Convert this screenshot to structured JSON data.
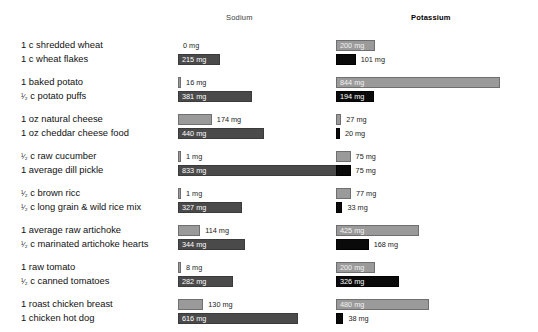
{
  "headers": {
    "sodium": "Sodium",
    "potassium": "Potassium"
  },
  "colors": {
    "light_bar": "#9a9a9a",
    "sodium_dark_bar": "#4a4a4a",
    "potassium_dark_bar": "#0a0a0a",
    "background": "#ffffff",
    "text": "#111111"
  },
  "units": "mg",
  "chart_data": {
    "type": "bar",
    "title": "",
    "subtitle": "",
    "xlabel": "",
    "ylabel": "",
    "orientation": "horizontal",
    "grid": false,
    "legend": [
      "Sodium",
      "Potassium"
    ],
    "legend_position": "top",
    "axis_max_mg": 850,
    "categories": [
      "1 c shredded wheat",
      "1 c wheat flakes",
      "1 baked potato",
      "1/2 c potato puffs",
      "1 oz natural cheese",
      "1 oz cheddar cheese food",
      "1/2 c raw cucumber",
      "1 average dill pickle",
      "1/2 c brown ricc",
      "1/2 c long grain & wild rice mix",
      "1 average raw artichoke",
      "1/2 c marinated artichoke hearts",
      "1 raw tomato",
      "1/2 c canned tomatoes",
      "1 roast chicken breast",
      "1 chicken hot dog"
    ],
    "series": [
      {
        "name": "Sodium",
        "values": [
          0,
          215,
          16,
          381,
          174,
          440,
          1,
          833,
          1,
          327,
          114,
          344,
          8,
          282,
          130,
          616
        ]
      },
      {
        "name": "Potassium",
        "values": [
          200,
          101,
          844,
          194,
          27,
          20,
          75,
          75,
          77,
          33,
          425,
          168,
          200,
          326,
          480,
          38
        ]
      }
    ]
  },
  "groups": [
    {
      "rows": [
        {
          "label_pre": "1 c shredded wheat",
          "label_frac": "",
          "label_post": "",
          "shade": "light",
          "sodium": {
            "value": "0 mg",
            "mg": 0,
            "inside": false
          },
          "potassium": {
            "value": "200 mg",
            "mg": 200,
            "inside": true
          }
        },
        {
          "label_pre": "1 c wheat flakes",
          "label_frac": "",
          "label_post": "",
          "shade": "dark",
          "sodium": {
            "value": "215 mg",
            "mg": 215,
            "inside": true
          },
          "potassium": {
            "value": "101 mg",
            "mg": 101,
            "inside": false
          }
        }
      ]
    },
    {
      "rows": [
        {
          "label_pre": "1 baked potato",
          "label_frac": "",
          "label_post": "",
          "shade": "light",
          "sodium": {
            "value": "16 mg",
            "mg": 16,
            "inside": false
          },
          "potassium": {
            "value": "844 mg",
            "mg": 844,
            "inside": true
          }
        },
        {
          "label_pre": "",
          "label_frac": "1/2",
          "label_post": " c potato puffs",
          "shade": "dark",
          "sodium": {
            "value": "381 mg",
            "mg": 381,
            "inside": true
          },
          "potassium": {
            "value": "194 mg",
            "mg": 194,
            "inside": true
          }
        }
      ]
    },
    {
      "rows": [
        {
          "label_pre": "1 oz natural cheese",
          "label_frac": "",
          "label_post": "",
          "shade": "light",
          "sodium": {
            "value": "174 mg",
            "mg": 174,
            "inside": false
          },
          "potassium": {
            "value": "27 mg",
            "mg": 27,
            "inside": false
          }
        },
        {
          "label_pre": "1 oz cheddar cheese food",
          "label_frac": "",
          "label_post": "",
          "shade": "dark",
          "sodium": {
            "value": "440 mg",
            "mg": 440,
            "inside": true
          },
          "potassium": {
            "value": "20 mg",
            "mg": 20,
            "inside": false
          }
        }
      ]
    },
    {
      "rows": [
        {
          "label_pre": "",
          "label_frac": "1/2",
          "label_post": " c raw cucumber",
          "shade": "light",
          "sodium": {
            "value": "1 mg",
            "mg": 1,
            "inside": false
          },
          "potassium": {
            "value": "75 mg",
            "mg": 75,
            "inside": false
          }
        },
        {
          "label_pre": "1 average dill pickle",
          "label_frac": "",
          "label_post": "",
          "shade": "dark",
          "sodium": {
            "value": "833 mg",
            "mg": 833,
            "inside": true
          },
          "potassium": {
            "value": "75 mg",
            "mg": 75,
            "inside": false
          }
        }
      ]
    },
    {
      "rows": [
        {
          "label_pre": "",
          "label_frac": "1/2",
          "label_post": " c brown ricc",
          "shade": "light",
          "sodium": {
            "value": "1 mg",
            "mg": 1,
            "inside": false
          },
          "potassium": {
            "value": "77 mg",
            "mg": 77,
            "inside": false
          }
        },
        {
          "label_pre": "",
          "label_frac": "1/2",
          "label_post": " c long grain & wild rice mix",
          "shade": "dark",
          "sodium": {
            "value": "327 mg",
            "mg": 327,
            "inside": true
          },
          "potassium": {
            "value": "33 mg",
            "mg": 33,
            "inside": false
          }
        }
      ]
    },
    {
      "rows": [
        {
          "label_pre": "1 average raw artichoke",
          "label_frac": "",
          "label_post": "",
          "shade": "light",
          "sodium": {
            "value": "114 mg",
            "mg": 114,
            "inside": false
          },
          "potassium": {
            "value": "425 mg",
            "mg": 425,
            "inside": true
          }
        },
        {
          "label_pre": "",
          "label_frac": "1/2",
          "label_post": " c marinated artichoke hearts",
          "shade": "dark",
          "sodium": {
            "value": "344 mg",
            "mg": 344,
            "inside": true
          },
          "potassium": {
            "value": "168 mg",
            "mg": 168,
            "inside": false
          }
        }
      ]
    },
    {
      "rows": [
        {
          "label_pre": "1 raw tomato",
          "label_frac": "",
          "label_post": "",
          "shade": "light",
          "sodium": {
            "value": "8 mg",
            "mg": 8,
            "inside": false
          },
          "potassium": {
            "value": "200 mg",
            "mg": 200,
            "inside": true
          }
        },
        {
          "label_pre": "",
          "label_frac": "1/2",
          "label_post": " c canned tomatoes",
          "shade": "dark",
          "sodium": {
            "value": "282 mg",
            "mg": 282,
            "inside": true
          },
          "potassium": {
            "value": "326 mg",
            "mg": 326,
            "inside": true
          }
        }
      ]
    },
    {
      "rows": [
        {
          "label_pre": "1 roast chicken breast",
          "label_frac": "",
          "label_post": "",
          "shade": "light",
          "sodium": {
            "value": "130 mg",
            "mg": 130,
            "inside": false
          },
          "potassium": {
            "value": "480 mg",
            "mg": 480,
            "inside": true
          }
        },
        {
          "label_pre": "1 chicken hot dog",
          "label_frac": "",
          "label_post": "",
          "shade": "dark",
          "sodium": {
            "value": "616 mg",
            "mg": 616,
            "inside": true
          },
          "potassium": {
            "value": "38 mg",
            "mg": 38,
            "inside": false
          }
        }
      ]
    }
  ]
}
